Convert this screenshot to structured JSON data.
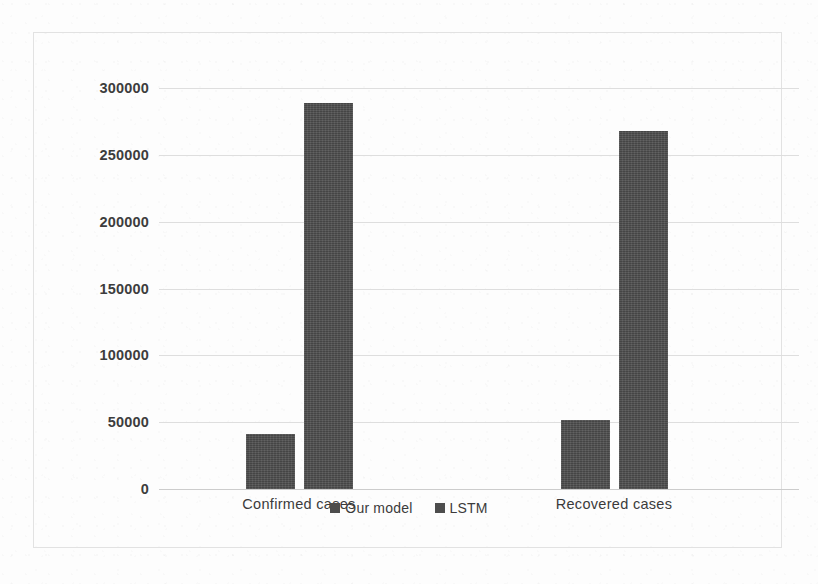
{
  "chart_data": {
    "type": "bar",
    "title": "",
    "subtitle": "",
    "xlabel": "",
    "ylabel": "",
    "categories": [
      "Confirmed cases",
      "Recovered cases"
    ],
    "series": [
      {
        "name": "Our model",
        "values": [
          41000,
          52000
        ],
        "color": "#4d4d4d"
      },
      {
        "name": "LSTM",
        "values": [
          289000,
          268000
        ],
        "color": "#4d4d4d"
      }
    ],
    "ylim": [
      0,
      300000
    ],
    "ytick_values": [
      0,
      50000,
      100000,
      150000,
      200000,
      250000,
      300000
    ],
    "ytick_labels": [
      "0",
      "50000",
      "100000",
      "150000",
      "200000",
      "250000",
      "300000"
    ],
    "grid": true,
    "grid_axis": "y",
    "legend_position": "bottom",
    "legend_entries": [
      "Our model",
      "LSTM"
    ],
    "annotations": []
  },
  "figure": {
    "frame_color": "#e2e2e2",
    "grid_color": "#dcdcdc",
    "background": "#fdfdfd",
    "text_color": "#3b3b3b"
  }
}
